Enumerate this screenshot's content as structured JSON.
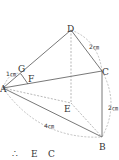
{
  "diagram": {
    "type": "pyramid-geometry",
    "rotation_deg": 90,
    "colors": {
      "line": "#555555",
      "dashed": "#888888",
      "background": "#ffffff"
    },
    "points": {
      "A": {
        "label": "A",
        "x": 3,
        "y": 88
      },
      "B": {
        "label": "B",
        "x": 102,
        "y": 137
      },
      "C": {
        "label": "C",
        "x": 102,
        "y": 71
      },
      "D": {
        "label": "D",
        "x": 71,
        "y": 30
      },
      "E": {
        "label": "E",
        "x": 71,
        "y": 103
      },
      "F": {
        "label": "F",
        "x": 28,
        "y": 80
      },
      "G": {
        "label": "G",
        "x": 21,
        "y": 74
      }
    },
    "measurements": {
      "AG": "1㎝",
      "DC": "2㎝",
      "CB": "2㎝",
      "AB": "4㎝"
    },
    "fragments": [
      "∴",
      "E",
      "C"
    ]
  }
}
